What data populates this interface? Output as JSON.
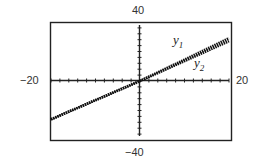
{
  "chart_data": {
    "type": "line",
    "title": "",
    "xlabel": "",
    "ylabel": "",
    "xlim": [
      -20,
      20
    ],
    "ylim": [
      -40,
      40
    ],
    "tick_labels": {
      "x_min": "−20",
      "x_max": "20",
      "y_min": "−40",
      "y_max": "40"
    },
    "grid": false,
    "series": [
      {
        "name": "y1",
        "x": [
          -20,
          0,
          20
        ],
        "y": [
          -26,
          0,
          29
        ]
      },
      {
        "name": "y2",
        "x": [
          -20,
          0,
          20
        ],
        "y": [
          -26,
          0,
          27
        ]
      }
    ],
    "annotations": [
      {
        "text": "y1",
        "x": 6,
        "y": 22
      },
      {
        "text": "y2",
        "x": 11,
        "y": 13
      }
    ]
  },
  "labels": {
    "ymax": "40",
    "ymin": "−40",
    "xmin": "−20",
    "xmax": "20",
    "y1_base": "y",
    "y1_sub": "1",
    "y2_base": "y",
    "y2_sub": "2"
  }
}
